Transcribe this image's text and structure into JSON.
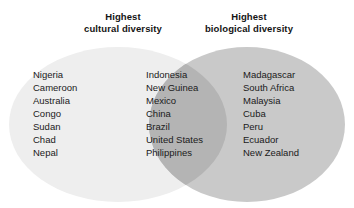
{
  "figure": {
    "type": "venn-diagram",
    "sets": [
      {
        "id": "cultural",
        "heading_line1": "Highest",
        "heading_line2": "cultural diversity",
        "fill_color": "#eeeeee"
      },
      {
        "id": "biological",
        "heading_line1": "Highest",
        "heading_line2": "biological diversity",
        "fill_color": "#c9c9c9"
      }
    ],
    "intersection_color": "#b4b4b4",
    "background_color": "#ffffff",
    "regions": {
      "cultural_only": [
        "Nigeria",
        "Cameroon",
        "Australia",
        "Congo",
        "Sudan",
        "Chad",
        "Nepal"
      ],
      "both": [
        "Indonesia",
        "New Guinea",
        "Mexico",
        "China",
        "Brazil",
        "United States",
        "Philippines"
      ],
      "biological_only": [
        "Madagascar",
        "South Africa",
        "Malaysia",
        "Cuba",
        "Peru",
        "Ecuador",
        "New Zealand"
      ]
    }
  }
}
